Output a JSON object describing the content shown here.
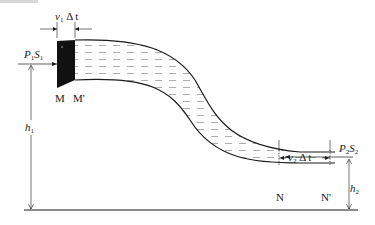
{
  "diagram": {
    "type": "Bernoulli flow tube (fluid in pipe)",
    "labels": {
      "v1dt": {
        "v": "v",
        "sub": "1",
        "rest": " Δ t"
      },
      "p1s1": {
        "p": "P",
        "psub": "1",
        "s": "S",
        "ssub": "1"
      },
      "M": "M",
      "M_prime": "M'",
      "h1": {
        "h": "h",
        "sub": "1"
      },
      "v2dt": {
        "v": "v",
        "sub": "2",
        "rest": " Δ t"
      },
      "p2s2": {
        "p": "P",
        "psub": "2",
        "s": "S",
        "ssub": "2"
      },
      "N": "N",
      "N_prime": "N'",
      "h2": {
        "h": "h",
        "sub": "2"
      }
    },
    "colors": {
      "stroke": "#1a1a1a",
      "fluid_dash": "#8a8a8a",
      "block": "#111111",
      "background": "#ffffff"
    }
  }
}
